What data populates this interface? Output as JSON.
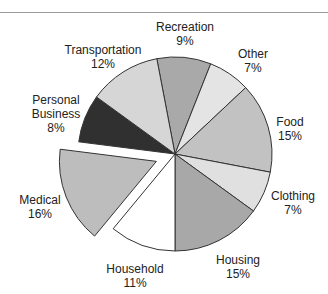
{
  "chart_data": {
    "type": "pie",
    "title": "",
    "start_angle_deg": -10.8,
    "direction": "clockwise",
    "slices": [
      {
        "label": "Recreation",
        "value": 9,
        "pct_label": "9%",
        "color": "#a9a9a9",
        "exploded": false
      },
      {
        "label": "Other",
        "value": 7,
        "pct_label": "7%",
        "color": "#e4e4e4",
        "exploded": false
      },
      {
        "label": "Food",
        "value": 15,
        "pct_label": "15%",
        "color": "#c2c2c2",
        "exploded": false
      },
      {
        "label": "Clothing",
        "value": 7,
        "pct_label": "7%",
        "color": "#e0e0e0",
        "exploded": false
      },
      {
        "label": "Housing",
        "value": 15,
        "pct_label": "15%",
        "color": "#a8a8a8",
        "exploded": false
      },
      {
        "label": "Household",
        "value": 11,
        "pct_label": "11%",
        "color": "#ffffff",
        "exploded": false
      },
      {
        "label": "Medical",
        "value": 16,
        "pct_label": "16%",
        "color": "#bdbdbd",
        "exploded": true
      },
      {
        "label": "Personal Business",
        "value": 8,
        "pct_label": "8%",
        "color": "#303030",
        "exploded": false
      },
      {
        "label": "Transportation",
        "value": 12,
        "pct_label": "12%",
        "color": "#d6d6d6",
        "exploded": false
      }
    ],
    "legend": "none (direct labels)"
  },
  "labels": {
    "recreation": {
      "name": "Recreation",
      "pct": "9%"
    },
    "other": {
      "name": "Other",
      "pct": "7%"
    },
    "food": {
      "name": "Food",
      "pct": "15%"
    },
    "clothing": {
      "name": "Clothing",
      "pct": "7%"
    },
    "housing": {
      "name": "Housing",
      "pct": "15%"
    },
    "household": {
      "name": "Household",
      "pct": "11%"
    },
    "medical": {
      "name": "Medical",
      "pct": "16%"
    },
    "personal_business": {
      "name1": "Personal",
      "name2": "Business",
      "pct": "8%"
    },
    "transportation": {
      "name": "Transportation",
      "pct": "12%"
    }
  }
}
